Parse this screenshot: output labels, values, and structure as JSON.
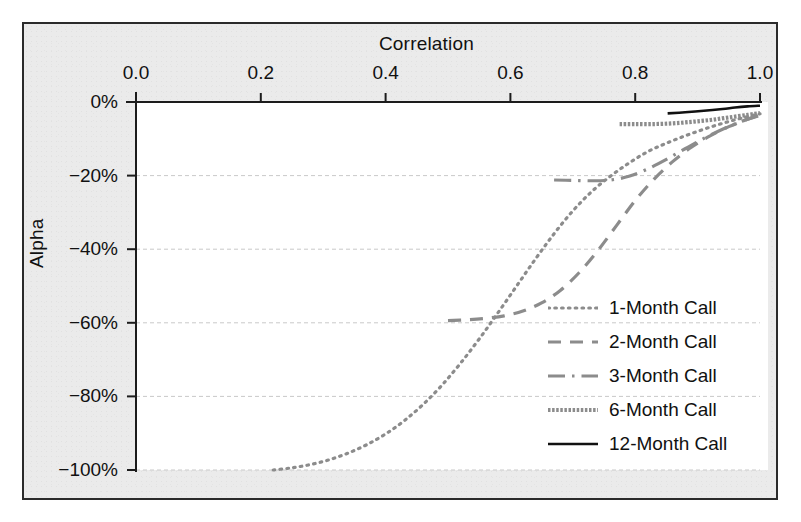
{
  "chart_data": {
    "type": "line",
    "title": "",
    "xlabel": "Correlation",
    "ylabel": "Alpha",
    "xlim": [
      0.0,
      1.0
    ],
    "ylim": [
      -100,
      0
    ],
    "xticks": [
      "0.0",
      "0.2",
      "0.4",
      "0.6",
      "0.8",
      "1.0"
    ],
    "xtick_values": [
      0.0,
      0.2,
      0.4,
      0.6,
      0.8,
      1.0
    ],
    "yticks": [
      "0%",
      "−20%",
      "−40%",
      "−60%",
      "−80%",
      "−100%"
    ],
    "ytick_values": [
      0,
      -20,
      -40,
      -60,
      -80,
      -100
    ],
    "grid": "horizontal-dashed",
    "x_axis_position": "top",
    "legend_position": "center-right",
    "series": [
      {
        "name": "1-Month Call",
        "style": "dotted",
        "color": "#8c8c8c",
        "x": [
          0.22,
          0.25,
          0.28,
          0.31,
          0.34,
          0.37,
          0.4,
          0.43,
          0.46,
          0.49,
          0.52,
          0.55,
          0.58,
          0.61,
          0.64,
          0.67,
          0.7,
          0.73,
          0.76,
          0.79,
          0.82,
          0.85,
          0.88,
          0.91,
          0.94,
          0.97,
          1.0
        ],
        "y": [
          -100.0,
          -99.4,
          -98.5,
          -97.2,
          -95.4,
          -93.1,
          -90.2,
          -86.6,
          -82.2,
          -77.0,
          -71.0,
          -64.4,
          -57.3,
          -50.0,
          -42.7,
          -35.8,
          -29.6,
          -24.4,
          -20.2,
          -16.6,
          -13.5,
          -11.2,
          -9.2,
          -7.4,
          -5.8,
          -4.4,
          -3.2
        ]
      },
      {
        "name": "2-Month Call",
        "style": "dashed",
        "color": "#8c8c8c",
        "x": [
          0.5,
          0.53,
          0.56,
          0.59,
          0.62,
          0.65,
          0.68,
          0.71,
          0.74,
          0.77,
          0.8,
          0.83,
          0.86,
          0.89,
          0.92,
          0.95,
          0.98,
          1.0
        ],
        "y": [
          -59.4,
          -59.2,
          -58.8,
          -58.1,
          -56.8,
          -54.6,
          -51.2,
          -46.4,
          -40.4,
          -33.6,
          -26.8,
          -21.0,
          -16.2,
          -12.3,
          -9.2,
          -6.7,
          -4.7,
          -3.5
        ]
      },
      {
        "name": "3-Month Call",
        "style": "dashdot",
        "color": "#8c8c8c",
        "x": [
          0.67,
          0.7,
          0.73,
          0.76,
          0.79,
          0.82,
          0.85,
          0.88,
          0.91,
          0.94,
          0.97,
          1.0
        ],
        "y": [
          -21.2,
          -21.3,
          -21.4,
          -21.2,
          -20.2,
          -18.2,
          -15.6,
          -12.7,
          -9.9,
          -7.4,
          -5.3,
          -3.6
        ]
      },
      {
        "name": "6-Month Call",
        "style": "fine-dash",
        "color": "#8c8c8c",
        "x": [
          0.775,
          0.8,
          0.83,
          0.86,
          0.89,
          0.92,
          0.95,
          0.98,
          1.0
        ],
        "y": [
          -6.0,
          -6.0,
          -6.0,
          -5.8,
          -5.4,
          -4.9,
          -4.2,
          -3.5,
          -3.0
        ]
      },
      {
        "name": "12-Month Call",
        "style": "solid",
        "color": "#111111",
        "x": [
          0.852,
          0.88,
          0.91,
          0.94,
          0.96,
          0.98,
          1.0
        ],
        "y": [
          -3.1,
          -2.8,
          -2.4,
          -1.9,
          -1.5,
          -1.2,
          -1.0
        ]
      }
    ]
  },
  "legend": {
    "entries": [
      {
        "label": "1-Month Call"
      },
      {
        "label": "2-Month Call"
      },
      {
        "label": "3-Month Call"
      },
      {
        "label": "6-Month Call"
      },
      {
        "label": "12-Month Call"
      }
    ]
  },
  "colors": {
    "series_gray": "#8c8c8c",
    "series_black": "#111111",
    "grid": "#c9c9c9",
    "axis": "#1c1c1c",
    "frame": "#2b2b2b",
    "paper": "#ebebeb",
    "plot_bg": "#ffffff"
  }
}
